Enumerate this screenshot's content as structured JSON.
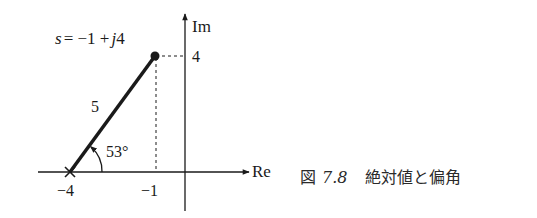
{
  "diagram": {
    "point_label": "s = −1 + j4",
    "point_label_parts": {
      "s": "s",
      "eq": "= −1 +",
      "j": "j",
      "num": "4"
    },
    "axis_re_label": "Re",
    "axis_im_label": "Im",
    "tick_re_neg4": "−4",
    "tick_re_neg1": "−1",
    "tick_im_4": "4",
    "magnitude_label": "5",
    "angle_label": "53°",
    "colors": {
      "ink": "#1a1a1a",
      "background": "#ffffff"
    }
  },
  "caption": {
    "prefix": "図",
    "number": "7.8",
    "title": "絶対値と偏角"
  }
}
